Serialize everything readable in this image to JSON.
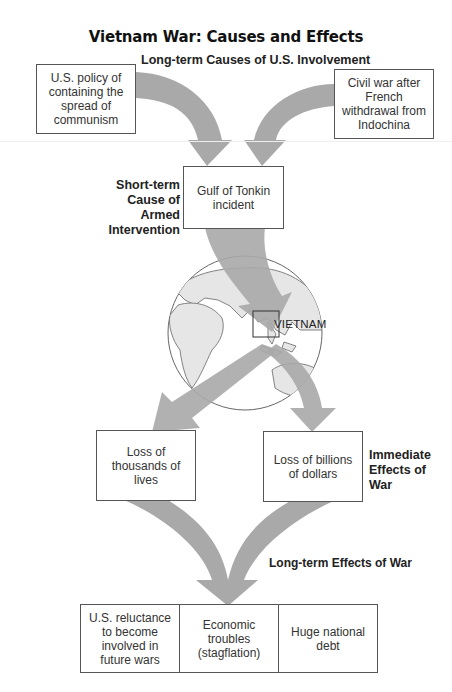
{
  "header": {
    "running_head": "",
    "title": "Vietnam War: Causes and Effects",
    "long_term_causes_label": "Long-term Causes of U.S. Involvement"
  },
  "long_term_causes": [
    {
      "text": "U.S. policy of containing the spread of communism"
    },
    {
      "text": "Civil war after French withdrawal from Indochina"
    }
  ],
  "short_term_cause": {
    "label": "Short-term Cause of Armed Intervention",
    "text": "Gulf of Tonkin incident"
  },
  "globe": {
    "label": "VIETNAM"
  },
  "immediate_effects": {
    "label": "Immediate Effects of War",
    "items": [
      {
        "text": "Loss of thousands of lives"
      },
      {
        "text": "Loss of billions of dollars"
      }
    ]
  },
  "long_term_effects": {
    "label": "Long-term Effects of War",
    "items": [
      {
        "text": "U.S. reluctance to become involved in future wars"
      },
      {
        "text": "Economic troubles (stagflation)"
      },
      {
        "text": "Huge national debt"
      }
    ]
  },
  "colors": {
    "arrow": "#a9a9a9",
    "land": "#e6e6e6",
    "outline": "#555555",
    "box_border": "#555555"
  }
}
